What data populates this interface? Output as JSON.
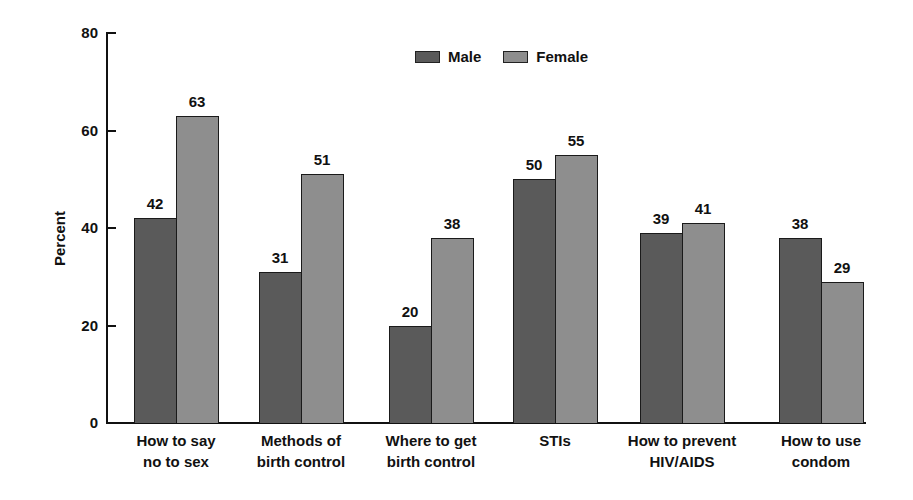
{
  "chart_data": {
    "type": "bar",
    "title": "",
    "xlabel": "",
    "ylabel": "Percent",
    "ylim": [
      0,
      80
    ],
    "yticks": [
      0,
      20,
      40,
      60,
      80
    ],
    "grid": false,
    "legend_position": "top-center",
    "categories": [
      "How to say no to sex",
      "Methods of birth control",
      "Where to get birth control",
      "STIs",
      "How to prevent HIV/AIDS",
      "How to use condom"
    ],
    "category_lines": [
      [
        "How to say",
        "no to sex"
      ],
      [
        "Methods of",
        "birth control"
      ],
      [
        "Where to get",
        "birth control"
      ],
      [
        "STIs",
        ""
      ],
      [
        "How to prevent",
        "HIV/AIDS"
      ],
      [
        "How to use",
        "condom"
      ]
    ],
    "series": [
      {
        "name": "Male",
        "color": "#5a5a5a",
        "values": [
          42,
          31,
          20,
          50,
          39,
          38
        ]
      },
      {
        "name": "Female",
        "color": "#8e8e8e",
        "values": [
          63,
          51,
          38,
          55,
          41,
          29
        ]
      }
    ],
    "value_labels": {
      "Male": [
        "42",
        "31",
        "20",
        "50",
        "39",
        "38"
      ],
      "Female": [
        "63",
        "51",
        "38",
        "55",
        "41",
        "29"
      ]
    }
  },
  "legend": {
    "male_label": "Male",
    "female_label": "Female"
  },
  "axis": {
    "y_title": "Percent",
    "y_tick_labels": [
      "0",
      "20",
      "40",
      "60",
      "80"
    ]
  }
}
